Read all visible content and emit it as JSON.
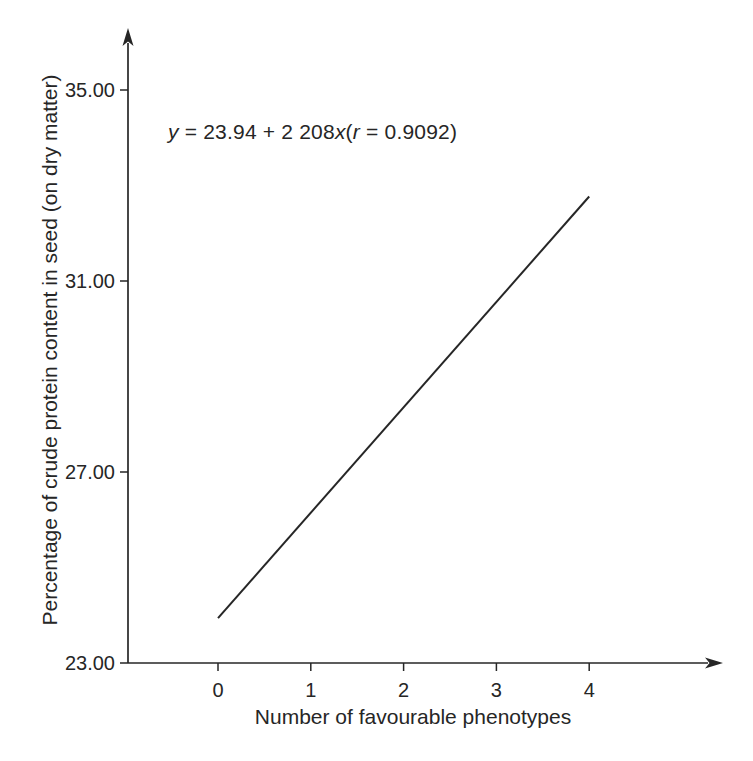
{
  "figure": {
    "background": "#ffffff",
    "ink": "#262626"
  },
  "chart_data": {
    "type": "line",
    "title": "",
    "xlabel": "Number of favourable phenotypes",
    "ylabel": "Percentage of crude protein content in seed (on dry matter)",
    "annotation": {
      "full_text": "y = 23.94 + 2 208x(r = 0.9092)",
      "segments": [
        {
          "text": "y",
          "italic": true
        },
        {
          "text": " = 23.94 + 2 208",
          "italic": false
        },
        {
          "text": "x",
          "italic": true
        },
        {
          "text": "(",
          "italic": false
        },
        {
          "text": "r",
          "italic": true
        },
        {
          "text": " = 0.9092)",
          "italic": false
        }
      ]
    },
    "x_ticks": [
      {
        "value": 0,
        "label": "0"
      },
      {
        "value": 1,
        "label": "1"
      },
      {
        "value": 2,
        "label": "2"
      },
      {
        "value": 3,
        "label": "3"
      },
      {
        "value": 4,
        "label": "4"
      }
    ],
    "y_ticks": [
      {
        "value": 35,
        "label": "35.00"
      },
      {
        "value": 31,
        "label": "31.00"
      },
      {
        "value": 27,
        "label": "27.00"
      },
      {
        "value": 23,
        "label": "23.00"
      }
    ],
    "xlim": [
      -0.97,
      5.4
    ],
    "ylim": [
      23.0,
      36.3
    ],
    "grid": false,
    "legend": "none",
    "series": [
      {
        "name": "regression-line",
        "x": [
          0,
          4
        ],
        "y": [
          23.94,
          32.77
        ]
      }
    ]
  }
}
